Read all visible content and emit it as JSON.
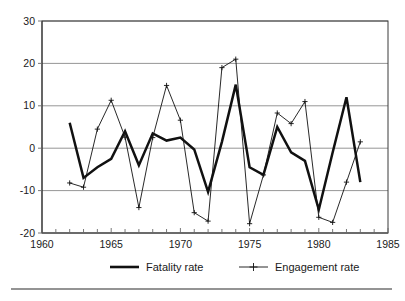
{
  "chart_data": {
    "type": "line",
    "title": "",
    "subtitle": "",
    "xlabel": "",
    "ylabel": "",
    "xlim": [
      1960,
      1985
    ],
    "ylim": [
      -20,
      30
    ],
    "yticks": [
      -20,
      -10,
      0,
      10,
      20,
      30
    ],
    "ytick_labels": [
      "-20",
      "-10",
      "0",
      "10",
      "20",
      "30"
    ],
    "xticks": [
      1960,
      1965,
      1970,
      1975,
      1980,
      1985
    ],
    "xtick_labels": [
      "1960",
      "1965",
      "1970",
      "1975",
      "1980",
      "1985"
    ],
    "x_minor_tick_step": 1,
    "grid": "horizontal",
    "grid_color": "#8a8a8a",
    "legend_position": "bottom",
    "x": [
      1962,
      1963,
      1964,
      1965,
      1966,
      1967,
      1968,
      1969,
      1970,
      1971,
      1972,
      1973,
      1974,
      1975,
      1976,
      1977,
      1978,
      1979,
      1980,
      1981,
      1982,
      1983
    ],
    "series": [
      {
        "name": "Fatality rate",
        "marker": "none",
        "line_style": "thick-solid",
        "color": "#111111",
        "x": [
          1962,
          1963,
          1964,
          1965,
          1966,
          1967,
          1968,
          1969,
          1970,
          1971,
          1972,
          1973,
          1974,
          1975,
          1976,
          1977,
          1978,
          1979,
          1980,
          1981,
          1982,
          1983
        ],
        "values": [
          6.0,
          -7.0,
          -4.5,
          -2.5,
          4.0,
          -4.0,
          3.5,
          1.8,
          2.5,
          -0.3,
          -10.3,
          1.5,
          15.0,
          -4.5,
          -6.3,
          5.0,
          -1.0,
          -3.0,
          -14.5,
          -1.0,
          12.0,
          -8.0
        ]
      },
      {
        "name": "Engagement rate",
        "marker": "plus",
        "line_style": "thin-solid",
        "color": "#111111",
        "x": [
          1962,
          1963,
          1964,
          1965,
          1966,
          1967,
          1968,
          1969,
          1970,
          1971,
          1972,
          1973,
          1974,
          1975,
          1976,
          1977,
          1978,
          1979,
          1980,
          1981,
          1982,
          1983
        ],
        "values": [
          -8.2,
          -9.2,
          4.5,
          11.3,
          2.6,
          -14.0,
          2.5,
          14.8,
          6.6,
          -15.2,
          -17.2,
          19.0,
          21.0,
          -17.8,
          -6.3,
          8.3,
          5.8,
          11.0,
          -16.3,
          -17.5,
          -8.0,
          1.5
        ]
      }
    ],
    "legend": [
      {
        "label": "Fatality rate",
        "marker": "none",
        "line_style": "thick-solid"
      },
      {
        "label": "Engagement rate",
        "marker": "plus",
        "line_style": "thin-solid"
      }
    ]
  }
}
